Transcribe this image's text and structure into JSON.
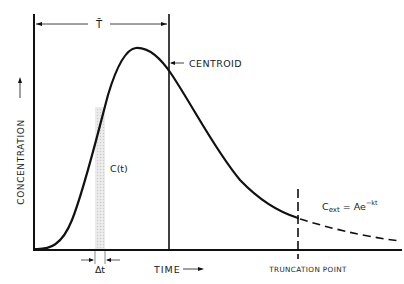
{
  "diagram": {
    "axes": {
      "x_label": "TIME",
      "x_arrow": "⟶",
      "y_label": "CONCENTRATION",
      "y_arrow": "⟶"
    },
    "annotations": {
      "mean_time": "T̄",
      "centroid": "CENTROID",
      "curve_label": "C(t)",
      "delta_t": "Δt",
      "truncation": "TRUNCATION POINT",
      "extrapolation_C": "C",
      "extrapolation_sub": "ext",
      "extrapolation_eq": " = Ae",
      "extrapolation_exp": "−kt"
    },
    "colors": {
      "line": "#111111",
      "strip": "#d9d9d9",
      "background": "#ffffff"
    }
  }
}
